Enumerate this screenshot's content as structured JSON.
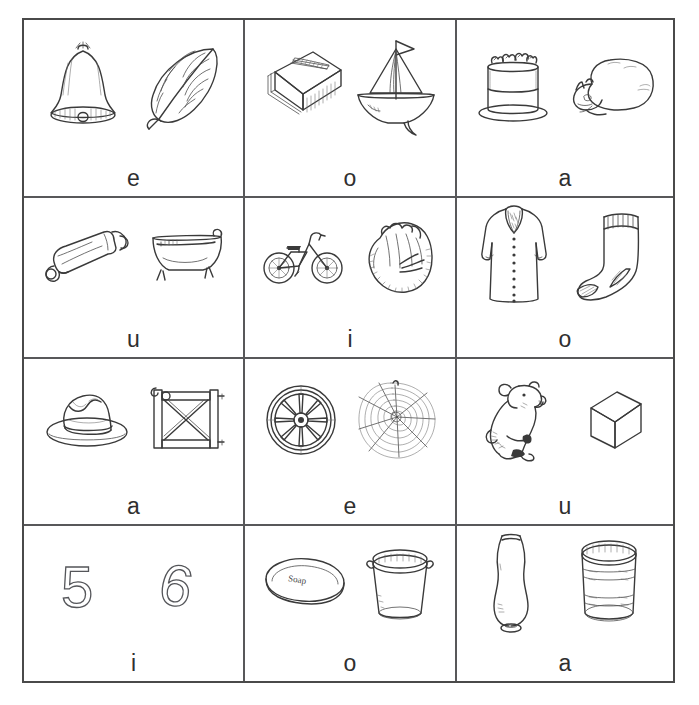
{
  "worksheet": {
    "title": "Short vowel picture sort worksheet",
    "grid": {
      "columns": 3,
      "rows": 4
    },
    "border_color": "#58585a",
    "background_color": "#ffffff",
    "letter_color": "#2f2f2f",
    "cells": [
      {
        "id": "cell-1",
        "row": 1,
        "col": 1,
        "letter": "e",
        "pictures": [
          "bell",
          "leaf"
        ]
      },
      {
        "id": "cell-2",
        "row": 1,
        "col": 2,
        "letter": "o",
        "pictures": [
          "book",
          "boat"
        ]
      },
      {
        "id": "cell-3",
        "row": 1,
        "col": 3,
        "letter": "a",
        "pictures": [
          "cake",
          "cat"
        ]
      },
      {
        "id": "cell-4",
        "row": 2,
        "col": 1,
        "letter": "u",
        "pictures": [
          "tube",
          "tub"
        ]
      },
      {
        "id": "cell-5",
        "row": 2,
        "col": 2,
        "letter": "i",
        "pictures": [
          "bike",
          "mitt"
        ]
      },
      {
        "id": "cell-6",
        "row": 2,
        "col": 3,
        "letter": "o",
        "pictures": [
          "coat",
          "sock"
        ]
      },
      {
        "id": "cell-7",
        "row": 3,
        "col": 1,
        "letter": "a",
        "pictures": [
          "hat",
          "gate"
        ]
      },
      {
        "id": "cell-8",
        "row": 3,
        "col": 2,
        "letter": "e",
        "pictures": [
          "wheel",
          "web"
        ]
      },
      {
        "id": "cell-9",
        "row": 3,
        "col": 3,
        "letter": "u",
        "pictures": [
          "cub",
          "cube"
        ]
      },
      {
        "id": "cell-10",
        "row": 4,
        "col": 1,
        "letter": "i",
        "pictures": [
          "five",
          "six"
        ]
      },
      {
        "id": "cell-11",
        "row": 4,
        "col": 2,
        "letter": "o",
        "pictures": [
          "soap",
          "pot"
        ]
      },
      {
        "id": "cell-12",
        "row": 4,
        "col": 3,
        "letter": "a",
        "pictures": [
          "vase",
          "can"
        ]
      }
    ],
    "labels": {
      "five": "5",
      "six": "6",
      "soap_label": "Soap"
    }
  }
}
